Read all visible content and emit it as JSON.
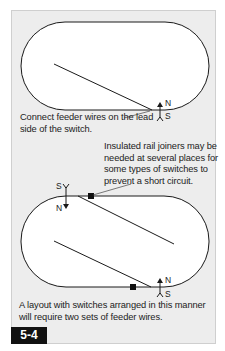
{
  "figure": {
    "number": "5-4",
    "colors": {
      "panel_bg": "#ededed",
      "track_fill": "#ffffff",
      "line": "#1a1a1a",
      "badge_bg": "#111111",
      "badge_text": "#ffffff"
    }
  },
  "top_diagram": {
    "caption": "Connect feeder wires on the lead side of the switch.",
    "feeder": {
      "north_label": "N",
      "south_label": "S"
    }
  },
  "bottom_diagram": {
    "joiner_note": "Insulated rail joiners may be needed at several places for some types of switches to prevent a short circuit.",
    "feeder_left": {
      "north_label": "N",
      "south_label": "S"
    },
    "feeder_right": {
      "north_label": "N",
      "south_label": "S"
    },
    "caption": "A layout with switches arranged in this manner will require two sets of feeder wires."
  }
}
